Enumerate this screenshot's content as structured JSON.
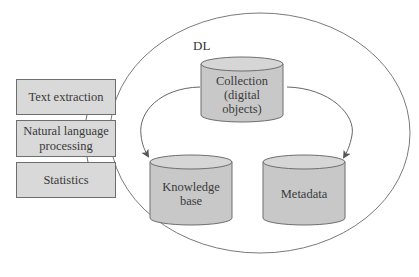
{
  "diagram": {
    "container": {
      "label": "DL"
    },
    "repositories": [
      {
        "id": "collection",
        "label": "Collection (digital objects)",
        "lines": [
          "Collection",
          "(digital",
          "objects)"
        ]
      },
      {
        "id": "knowledge-base",
        "label": "Knowledge base",
        "lines": [
          "Knowledge",
          "base"
        ]
      },
      {
        "id": "metadata",
        "label": "Metadata",
        "lines": [
          "Metadata"
        ]
      }
    ],
    "tools": [
      {
        "id": "text-extraction",
        "label": "Text extraction",
        "lines": [
          "Text extraction"
        ]
      },
      {
        "id": "nlp",
        "label": "Natural language processing",
        "lines": [
          "Natural language",
          "processing"
        ]
      },
      {
        "id": "statistics",
        "label": "Statistics",
        "lines": [
          "Statistics"
        ]
      }
    ],
    "edges": [
      {
        "from": "collection",
        "to": "knowledge-base",
        "style": "curved-arrow"
      },
      {
        "from": "collection",
        "to": "metadata",
        "style": "curved-arrow"
      }
    ],
    "colors": {
      "cylinder_fill": "#c8c8c8",
      "cylinder_top": "#d6d6d6",
      "box_fill": "#d9d9d9",
      "stroke": "#6e6e6e",
      "text": "#3a3a3a"
    }
  }
}
